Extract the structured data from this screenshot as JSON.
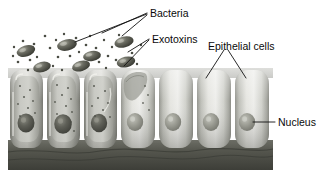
{
  "figure": {
    "labels": {
      "bacteria": "Bacteria",
      "exotoxins": "Exotoxins",
      "epithelial_cells": "Epithelial cells",
      "nucleus": "Nucleus"
    },
    "colors": {
      "label_text": "#0a0a0a",
      "leader_line": "#111111",
      "background": "#ffffff",
      "bacterium_body": "#5d5f55",
      "bacterium_dark": "#3c3e36",
      "bacterium_highlight": "#b9bab0",
      "toxin_dot": "#4a4c44",
      "cell_healthy_light": "#e6e6e2",
      "cell_healthy_mid": "#c9cac4",
      "cell_healthy_shadow": "#9a9b95",
      "cell_damaged_light": "#d8d8d2",
      "cell_damaged_mid": "#a9aaa3",
      "cell_damaged_shadow": "#76776f",
      "nucleus_healthy": "#9a9b92",
      "nucleus_damaged": "#55564e",
      "basement_membrane": "#4e4f48",
      "apical_surface": "#8b8c85"
    },
    "cells": [
      {
        "id": "cell-1",
        "state": "damaged",
        "x": 10,
        "width": 33,
        "nucleus_shape": "irregular",
        "toxin_dots_inside": 9
      },
      {
        "id": "cell-2",
        "state": "damaged",
        "x": 47,
        "width": 33,
        "nucleus_shape": "irregular",
        "toxin_dots_inside": 10
      },
      {
        "id": "cell-3",
        "state": "damaged",
        "x": 84,
        "width": 33,
        "nucleus_shape": "irregular",
        "toxin_dots_inside": 8
      },
      {
        "id": "cell-4",
        "state": "transitional",
        "x": 121,
        "width": 34,
        "nucleus_shape": "round",
        "toxin_dots_inside": 4
      },
      {
        "id": "cell-5",
        "state": "healthy",
        "x": 159,
        "width": 34,
        "nucleus_shape": "round",
        "toxin_dots_inside": 0
      },
      {
        "id": "cell-6",
        "state": "healthy",
        "x": 197,
        "width": 34,
        "nucleus_shape": "round",
        "toxin_dots_inside": 0
      },
      {
        "id": "cell-7",
        "state": "healthy",
        "x": 235,
        "width": 34,
        "nucleus_shape": "round",
        "toxin_dots_inside": 0
      }
    ],
    "bacteria": [
      {
        "id": "bacterium-1",
        "cx": 26,
        "cy": 51,
        "rx": 9.5,
        "ry": 5.5,
        "rotate": -17
      },
      {
        "id": "bacterium-2",
        "cx": 42,
        "cy": 67,
        "rx": 9.0,
        "ry": 5.2,
        "rotate": -14
      },
      {
        "id": "bacterium-3",
        "cx": 67,
        "cy": 45,
        "rx": 10.0,
        "ry": 5.6,
        "rotate": -12
      },
      {
        "id": "bacterium-4",
        "cx": 81,
        "cy": 66,
        "rx": 9.2,
        "ry": 5.2,
        "rotate": -15
      },
      {
        "id": "bacterium-5",
        "cx": 92,
        "cy": 56,
        "rx": 9.0,
        "ry": 5.0,
        "rotate": -10
      },
      {
        "id": "bacterium-6",
        "cx": 124,
        "cy": 42,
        "rx": 9.8,
        "ry": 5.5,
        "rotate": -14
      },
      {
        "id": "bacterium-7",
        "cx": 126,
        "cy": 62,
        "rx": 9.4,
        "ry": 5.3,
        "rotate": -13
      }
    ],
    "toxin_dots": [
      {
        "cx": 18,
        "cy": 62
      },
      {
        "cx": 23,
        "cy": 41
      },
      {
        "cx": 34,
        "cy": 44
      },
      {
        "cx": 13,
        "cy": 56
      },
      {
        "cx": 30,
        "cy": 60
      },
      {
        "cx": 37,
        "cy": 57
      },
      {
        "cx": 45,
        "cy": 36
      },
      {
        "cx": 50,
        "cy": 48
      },
      {
        "cx": 56,
        "cy": 40
      },
      {
        "cx": 58,
        "cy": 57
      },
      {
        "cx": 64,
        "cy": 34
      },
      {
        "cx": 70,
        "cy": 56
      },
      {
        "cx": 76,
        "cy": 38
      },
      {
        "cx": 79,
        "cy": 52
      },
      {
        "cx": 86,
        "cy": 45
      },
      {
        "cx": 90,
        "cy": 36
      },
      {
        "cx": 96,
        "cy": 48
      },
      {
        "cx": 99,
        "cy": 62
      },
      {
        "cx": 104,
        "cy": 40
      },
      {
        "cx": 108,
        "cy": 56
      },
      {
        "cx": 112,
        "cy": 47
      },
      {
        "cx": 116,
        "cy": 60
      },
      {
        "cx": 119,
        "cy": 35
      },
      {
        "cx": 132,
        "cy": 53
      },
      {
        "cx": 137,
        "cy": 64
      },
      {
        "cx": 141,
        "cy": 45
      },
      {
        "cx": 28,
        "cy": 70
      },
      {
        "cx": 53,
        "cy": 66
      },
      {
        "cx": 62,
        "cy": 70
      },
      {
        "cx": 106,
        "cy": 68
      },
      {
        "cx": 14,
        "cy": 47
      },
      {
        "cx": 72,
        "cy": 45
      }
    ],
    "leaders": {
      "bacteria": [
        {
          "id": "bacteria-leader-1",
          "path": "M147,13 L102,33"
        },
        {
          "id": "bacteria-leader-2",
          "path": "M147,14 L75,42"
        },
        {
          "id": "bacteria-leader-3",
          "path": "M147,15 L122,36"
        }
      ],
      "exotoxins": [
        {
          "id": "exotoxins-leader-1",
          "path": "M149,39 L128,52"
        },
        {
          "id": "exotoxins-leader-2",
          "path": "M149,40 L124,66"
        }
      ],
      "epithelial_cells": [
        {
          "id": "epithelial-leader-1",
          "path": "M224,50 L206,78"
        },
        {
          "id": "epithelial-leader-2",
          "path": "M228,50 L246,78"
        }
      ],
      "nucleus": [
        {
          "id": "nucleus-leader-1",
          "path": "M253,122 L275,122"
        }
      ]
    },
    "label_positions": {
      "bacteria": {
        "x": 150,
        "y": 14
      },
      "exotoxins": {
        "x": 152,
        "y": 40
      },
      "epithelial_cells": {
        "x": 208,
        "y": 47
      },
      "nucleus": {
        "x": 278,
        "y": 126
      }
    }
  }
}
